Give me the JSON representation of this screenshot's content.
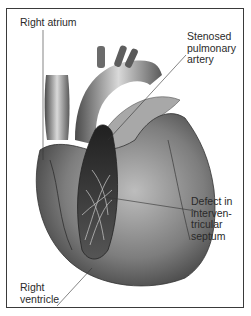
{
  "diagram": {
    "labels": {
      "right_atrium": "Right atrium",
      "stenosed_pulmonary_artery": "Stenosed\npulmonary\nartery",
      "defect_septum": "Defect in\ninterven-\ntricular\nseptum",
      "right_ventricle": "Right\nventricle"
    },
    "colors": {
      "frame": "#3a3a3a",
      "ink": "#2a2a2a",
      "tissue_dark": "#3c3c3c",
      "tissue_mid": "#8a8a8a",
      "tissue_light": "#cfcfcf"
    }
  }
}
